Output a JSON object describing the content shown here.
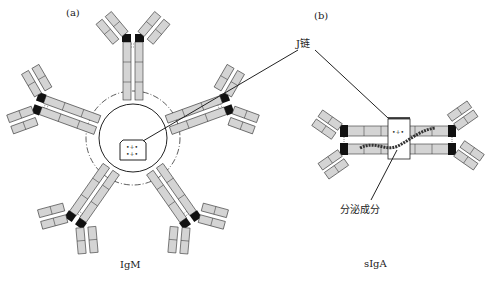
{
  "panels": {
    "a": {
      "label": "(a)",
      "caption": "IgM"
    },
    "b": {
      "label": "(b)",
      "caption": "sIgA"
    }
  },
  "annotations": {
    "j_chain": "J链",
    "secretory_component": "分泌成分"
  },
  "domains": {
    "heavy_variable": "VH",
    "light_variable": "VL",
    "heavy_constant_1": "Cμ1",
    "heavy_constant_2": "Cμ2",
    "heavy_constant_3": "Cμ3",
    "heavy_constant_4": "Cμ4",
    "light_constant": "CL",
    "alpha_constant_1": "Cα1",
    "alpha_constant_2": "Cα2",
    "alpha_constant_3": "Cα3"
  },
  "structure": {
    "igm_monomer_count": 5,
    "siga_monomer_count": 2
  },
  "colors": {
    "domain_fill": "#d4d4d4",
    "hinge": "#111111",
    "line": "#222222"
  }
}
